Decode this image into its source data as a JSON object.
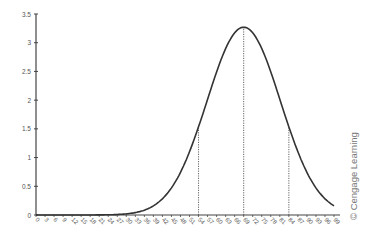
{
  "chart_data": {
    "type": "line",
    "title": "",
    "xlabel": "",
    "ylabel": "",
    "xlim": [
      0,
      99
    ],
    "ylim": [
      0,
      3.5
    ],
    "grid": false,
    "legend": null,
    "x_ticks": [
      0,
      3,
      6,
      9,
      12,
      15,
      18,
      21,
      24,
      27,
      30,
      33,
      36,
      39,
      42,
      45,
      48,
      51,
      54,
      57,
      60,
      63,
      66,
      69,
      72,
      75,
      78,
      81,
      84,
      87,
      90,
      93,
      96,
      99
    ],
    "y_ticks": [
      0,
      0.5,
      1,
      1.5,
      2,
      2.5,
      3,
      3.5
    ],
    "y_tick_labels": [
      "0",
      "0.5",
      "1",
      "1.5",
      "2",
      "2.5",
      "3",
      "3.5"
    ],
    "series": [
      {
        "name": "normal curve",
        "distribution": {
          "mean": 69,
          "sd": 12.2,
          "scale": 100
        },
        "x": [
          0,
          10,
          20,
          24,
          30,
          36,
          40,
          45,
          50,
          54,
          57,
          60,
          63,
          66,
          69,
          72,
          75,
          78,
          81,
          84,
          87,
          90,
          93,
          96,
          99
        ],
        "y": [
          0.0,
          0.0,
          0.01,
          0.02,
          0.02,
          0.09,
          0.19,
          0.47,
          0.97,
          1.54,
          2.03,
          2.5,
          2.9,
          3.17,
          3.27,
          3.17,
          2.9,
          2.5,
          2.03,
          1.54,
          1.1,
          0.74,
          0.47,
          0.28,
          0.16
        ]
      }
    ],
    "reference_lines": [
      {
        "x": 54,
        "style": "dotted",
        "y_top": 1.54
      },
      {
        "x": 69,
        "style": "dotted",
        "y_top": 3.27
      },
      {
        "x": 84,
        "style": "dotted",
        "y_top": 1.54
      }
    ],
    "annotations": [
      "© Cengage Learning"
    ]
  },
  "credit": "© Cengage Learning"
}
